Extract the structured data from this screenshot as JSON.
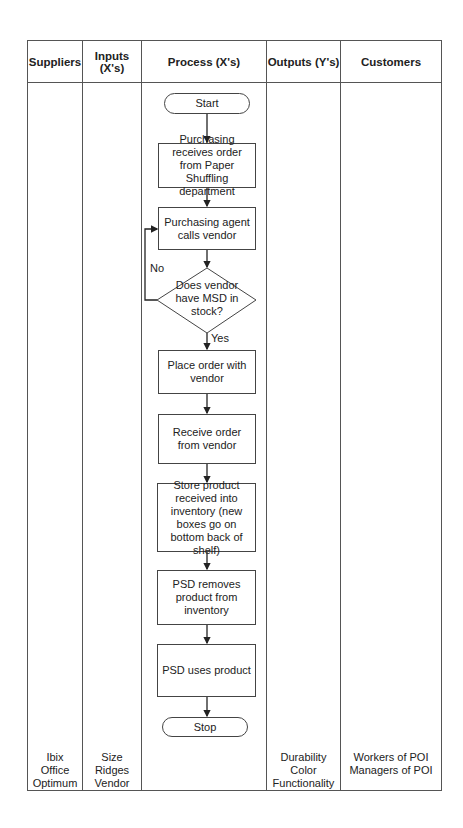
{
  "table": {
    "columns": [
      {
        "header": "Suppliers",
        "footer": [
          "Ibix",
          "Office",
          "Optimum"
        ]
      },
      {
        "header": "Inputs (X's)",
        "footer": [
          "Size",
          "Ridges",
          "Vendor"
        ]
      },
      {
        "header": "Process (X's)",
        "footer": []
      },
      {
        "header": "Outputs (Y's)",
        "footer": [
          "Durability",
          "Color",
          "Functionality"
        ]
      },
      {
        "header": "Customers",
        "footer": [
          "Workers of POI",
          "Managers of POI"
        ]
      }
    ]
  },
  "flowchart": {
    "start": "Start",
    "steps": [
      "Purchasing receives order from Paper Shuffling department",
      "Purchasing agent calls vendor"
    ],
    "decision": "Does vendor have MSD in stock?",
    "decision_no_label": "No",
    "decision_yes_label": "Yes",
    "steps_after": [
      "Place order with vendor",
      "Receive order from vendor",
      "Store product received into inventory (new boxes go on bottom back of shelf)",
      "PSD removes product from inventory",
      "PSD uses product"
    ],
    "stop": "Stop"
  }
}
